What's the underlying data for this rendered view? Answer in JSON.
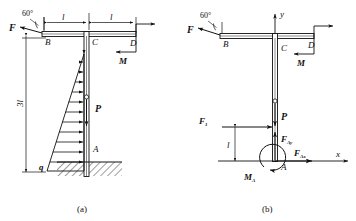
{
  "figure": {
    "panels": [
      {
        "caption": "(a)",
        "title": "structure-with-loads",
        "nodes": [
          {
            "id": "B",
            "label": "B"
          },
          {
            "id": "C",
            "label": "C"
          },
          {
            "id": "D",
            "label": "D"
          },
          {
            "id": "A",
            "label": "A"
          }
        ],
        "loads": [
          {
            "name": "F",
            "label": "F",
            "kind": "point-force",
            "angle_label": "60°",
            "at": "B"
          },
          {
            "name": "M",
            "label": "M",
            "kind": "couple",
            "at": "D"
          },
          {
            "name": "P",
            "label": "P",
            "kind": "point-force",
            "at": "column"
          },
          {
            "name": "q",
            "label": "q",
            "kind": "distributed-triangular",
            "at": "column-left"
          }
        ],
        "dimensions": [
          {
            "label": "l",
            "span": "B-C"
          },
          {
            "label": "l",
            "span": "C-D"
          },
          {
            "label": "3l",
            "span": "A-beam"
          }
        ],
        "angle": "60°"
      },
      {
        "caption": "(b)",
        "title": "free-body-diagram",
        "nodes": [
          {
            "id": "B",
            "label": "B"
          },
          {
            "id": "C",
            "label": "C"
          },
          {
            "id": "D",
            "label": "D"
          },
          {
            "id": "A",
            "label": "A"
          }
        ],
        "axes": [
          {
            "name": "y-axis",
            "label": "y"
          },
          {
            "name": "x-axis",
            "label": "x"
          }
        ],
        "loads": [
          {
            "name": "F",
            "label": "F",
            "kind": "point-force",
            "angle_label": "60°",
            "at": "B"
          },
          {
            "name": "M",
            "label": "M",
            "kind": "couple",
            "at": "D"
          },
          {
            "name": "P",
            "label": "P",
            "kind": "point-force",
            "at": "column"
          },
          {
            "name": "F1",
            "label": "F",
            "sub": "1",
            "kind": "resultant-force"
          },
          {
            "name": "FAy",
            "label": "F",
            "sub": "Ay",
            "kind": "reaction-force"
          },
          {
            "name": "FAx",
            "label": "F",
            "sub": "Ax",
            "kind": "reaction-force"
          },
          {
            "name": "MA",
            "label": "M",
            "sub": "A",
            "kind": "reaction-moment"
          }
        ],
        "dimensions": [
          {
            "label": "l",
            "span": "F1-to-A"
          }
        ],
        "angle": "60°"
      }
    ],
    "colors": {
      "line": "#111111",
      "background": "#ffffff",
      "hatch": "#333333"
    }
  }
}
